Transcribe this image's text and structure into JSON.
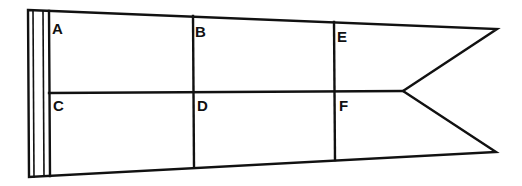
{
  "diagram": {
    "type": "pennant-flag-grid",
    "stroke_color": "#111111",
    "background": "#ffffff",
    "sections": [
      {
        "label": "A",
        "x": 52,
        "y": 21
      },
      {
        "label": "B",
        "x": 195,
        "y": 24
      },
      {
        "label": "E",
        "x": 337,
        "y": 29
      },
      {
        "label": "C",
        "x": 53,
        "y": 98
      },
      {
        "label": "D",
        "x": 197,
        "y": 98
      },
      {
        "label": "F",
        "x": 339,
        "y": 98
      }
    ]
  }
}
